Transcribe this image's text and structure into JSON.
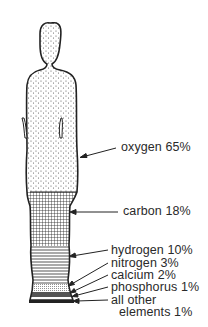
{
  "diagram": {
    "labels": [
      {
        "element": "oxygen",
        "percent": "65%",
        "text": "oxygen 65%"
      },
      {
        "element": "carbon",
        "percent": "18%",
        "text": "carbon 18%"
      },
      {
        "element": "hydrogen",
        "percent": "10%",
        "text": "hydrogen 10%"
      },
      {
        "element": "nitrogen",
        "percent": "3%",
        "text": "nitrogen 3%"
      },
      {
        "element": "calcium",
        "percent": "2%",
        "text": "calcium 2%"
      },
      {
        "element": "phosphorus",
        "percent": "1%",
        "text": "phosphorus 1%"
      },
      {
        "element": "all other elements",
        "percent": "1%",
        "text_line1": "all other",
        "text_line2": "elements 1%"
      }
    ],
    "fills": {
      "oxygen": "stipple",
      "carbon": "crosshatch",
      "hydrogen": "horizontal-lines",
      "nitrogen": "horizontal-lines-dense",
      "calcium": "vertical-dots",
      "phosphorus": "dark-band",
      "other": "white-band"
    },
    "colors": {
      "ink": "#2a2a2a",
      "background": "#ffffff"
    }
  }
}
